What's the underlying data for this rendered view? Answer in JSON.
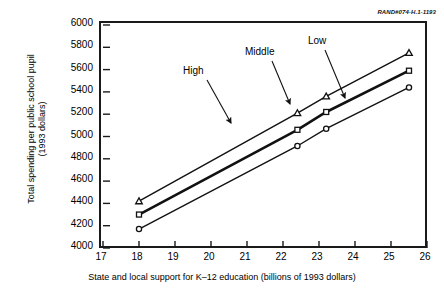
{
  "corner_tag": "RAND#074-H.1-1193",
  "chart_data": {
    "type": "line",
    "title": "",
    "xlabel": "State and local support for K–12 education (billions of 1993 dollars)",
    "ylabel_line1": "Total spending per public school pupil",
    "ylabel_line2": "(1993 dollars)",
    "xlim": [
      17,
      26
    ],
    "ylim": [
      4000,
      6000
    ],
    "xticks": [
      17,
      18,
      19,
      20,
      21,
      22,
      23,
      24,
      25,
      26
    ],
    "yticks": [
      4000,
      4200,
      4400,
      4600,
      4800,
      5000,
      5200,
      5400,
      5600,
      5800,
      6000
    ],
    "grid": false,
    "legend_position": "inline-annotations",
    "x": [
      18.0,
      22.4,
      23.2,
      25.5
    ],
    "series": [
      {
        "name": "High",
        "marker": "triangle",
        "line_width": 1.4,
        "values": [
          4420,
          5210,
          5360,
          5750
        ]
      },
      {
        "name": "Middle",
        "marker": "square",
        "line_width": 2.6,
        "values": [
          4300,
          5060,
          5220,
          5590
        ]
      },
      {
        "name": "Low",
        "marker": "circle",
        "line_width": 1.4,
        "values": [
          4170,
          4915,
          5070,
          5440
        ]
      }
    ],
    "annotations": [
      {
        "label": "High",
        "x": 183,
        "y": 66,
        "arrow_from": [
          207,
          80
        ],
        "arrow_to": [
          231,
          123
        ]
      },
      {
        "label": "Middle",
        "x": 245,
        "y": 47,
        "arrow_from": [
          272,
          61
        ],
        "arrow_to": [
          290,
          104
        ]
      },
      {
        "label": "Low",
        "x": 308,
        "y": 36,
        "arrow_from": [
          325,
          50
        ],
        "arrow_to": [
          345,
          98
        ]
      }
    ]
  }
}
